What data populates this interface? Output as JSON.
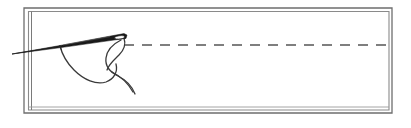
{
  "figure": {
    "kind": "line-art-illustration",
    "caption": "",
    "canvas": {
      "width": 411,
      "height": 128
    },
    "background_color": "#ffffff"
  },
  "frame": {
    "name": "rectangular border",
    "outer_rect": {
      "x": 24,
      "y": 8,
      "width": 368,
      "height": 105
    },
    "inner_rect": {
      "x": 28,
      "y": 11,
      "width": 361,
      "height": 99
    },
    "stroke_color": "#6e6e6e",
    "stroke_width": 1.3,
    "double_edge_sides": "left-and-bottom"
  },
  "dashed_line": {
    "name": "stitch guide line",
    "y": 45,
    "x_start": 124,
    "x_end": 389,
    "stroke_color": "#555555",
    "stroke_width": 1.4,
    "dash_length": 10,
    "gap_length": 8
  },
  "needle": {
    "name": "sewing needle",
    "tip_point": {
      "x": 12,
      "y": 54
    },
    "eye_point": {
      "x": 126,
      "y": 37
    },
    "body_color": "#1a1a1a",
    "outline_color": "#111111",
    "eye_hole": {
      "cx": 120,
      "cy": 38,
      "rx": 5,
      "ry": 2.6
    },
    "shaft_max_thickness": 5
  },
  "thread": {
    "name": "thread",
    "stroke_color": "#3a3a3a",
    "stroke_width": 1.3,
    "strands": [
      {
        "id": "strand-front-loop",
        "description": "thread passing through needle eye looping downward left"
      },
      {
        "id": "strand-long-tail",
        "description": "long thread tail sweeping from needle tip down and right"
      },
      {
        "id": "strand-lower-tail",
        "description": "short free thread end curving down to lower right"
      }
    ]
  },
  "colors": {
    "ink": "#1a1a1a",
    "frame": "#6e6e6e",
    "thread": "#3a3a3a",
    "paper": "#ffffff"
  }
}
